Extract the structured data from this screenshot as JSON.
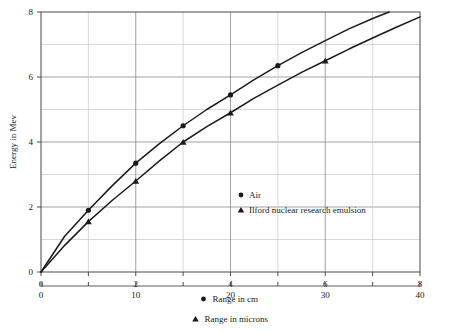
{
  "chart_data": {
    "type": "line",
    "title": "",
    "ylabel": "Energy in Mev",
    "ylim": [
      0,
      8
    ],
    "y_ticks": [
      0,
      2,
      4,
      6,
      8
    ],
    "y_tick_labels": [
      "0",
      "2",
      "4",
      "6",
      "8"
    ],
    "y_minor_gridlines": [
      1,
      2,
      3,
      4,
      5,
      6,
      7
    ],
    "grid": true,
    "legend_position": "inside-center-right",
    "x_axes": [
      {
        "name": "primary",
        "xlabel": "Range in cm",
        "marker": "circle",
        "xlim": [
          0,
          8
        ],
        "ticks": [
          0,
          1,
          2,
          3,
          4,
          5,
          6,
          7,
          8
        ],
        "tick_labels": [
          "0",
          "",
          "2",
          "",
          "4",
          "",
          "6",
          "",
          "8"
        ],
        "labeled_ticks": [
          {
            "value": 0,
            "label": "0"
          },
          {
            "value": 2,
            "label": "2"
          },
          {
            "value": 4,
            "label": "4"
          },
          {
            "value": 6,
            "label": "6"
          },
          {
            "value": 8,
            "label": "8"
          }
        ]
      },
      {
        "name": "secondary",
        "xlabel": "Range in microns",
        "marker": "triangle",
        "xlim": [
          0,
          40
        ],
        "ticks": [
          0,
          5,
          10,
          15,
          20,
          25,
          30,
          35,
          40
        ],
        "labeled_ticks": [
          {
            "value": 0,
            "label": "0"
          },
          {
            "value": 10,
            "label": "10"
          },
          {
            "value": 20,
            "label": "20"
          },
          {
            "value": 30,
            "label": "30"
          },
          {
            "value": 40,
            "label": "40"
          }
        ]
      }
    ],
    "series": [
      {
        "name": "Air",
        "marker": "circle",
        "x_axis": "primary",
        "x_unit": "cm",
        "points": [
          {
            "x": 1,
            "y": 1.9
          },
          {
            "x": 2,
            "y": 3.35
          },
          {
            "x": 3,
            "y": 4.5
          },
          {
            "x": 4,
            "y": 5.45
          },
          {
            "x": 5,
            "y": 6.35
          }
        ],
        "curve": [
          {
            "x": 0,
            "y": 0
          },
          {
            "x": 0.5,
            "y": 1.1
          },
          {
            "x": 1,
            "y": 1.9
          },
          {
            "x": 1.5,
            "y": 2.65
          },
          {
            "x": 2,
            "y": 3.35
          },
          {
            "x": 2.5,
            "y": 3.95
          },
          {
            "x": 3,
            "y": 4.5
          },
          {
            "x": 3.5,
            "y": 5.0
          },
          {
            "x": 4,
            "y": 5.45
          },
          {
            "x": 4.5,
            "y": 5.92
          },
          {
            "x": 5,
            "y": 6.35
          },
          {
            "x": 5.5,
            "y": 6.75
          },
          {
            "x": 6,
            "y": 7.12
          },
          {
            "x": 6.5,
            "y": 7.48
          },
          {
            "x": 7,
            "y": 7.8
          },
          {
            "x": 7.35,
            "y": 8.0
          }
        ]
      },
      {
        "name": "Ilford nuclear research emulsion",
        "marker": "triangle",
        "x_axis": "secondary",
        "x_unit": "microns",
        "points": [
          {
            "x": 5,
            "y": 1.55
          },
          {
            "x": 10,
            "y": 2.8
          },
          {
            "x": 15,
            "y": 4.0
          },
          {
            "x": 20,
            "y": 4.9
          },
          {
            "x": 30,
            "y": 6.5
          }
        ],
        "curve": [
          {
            "x": 0,
            "y": 0
          },
          {
            "x": 2.5,
            "y": 0.82
          },
          {
            "x": 5,
            "y": 1.55
          },
          {
            "x": 7.5,
            "y": 2.2
          },
          {
            "x": 10,
            "y": 2.8
          },
          {
            "x": 12.5,
            "y": 3.42
          },
          {
            "x": 15,
            "y": 4.0
          },
          {
            "x": 17.5,
            "y": 4.47
          },
          {
            "x": 20,
            "y": 4.9
          },
          {
            "x": 22.5,
            "y": 5.35
          },
          {
            "x": 25,
            "y": 5.75
          },
          {
            "x": 27.5,
            "y": 6.14
          },
          {
            "x": 30,
            "y": 6.5
          },
          {
            "x": 32.5,
            "y": 6.86
          },
          {
            "x": 35,
            "y": 7.2
          },
          {
            "x": 37.5,
            "y": 7.53
          },
          {
            "x": 40,
            "y": 7.85
          }
        ]
      }
    ],
    "legend": [
      {
        "label": "Air",
        "marker": "circle"
      },
      {
        "label": "Ilford nuclear research emulsion",
        "marker": "triangle"
      }
    ],
    "colors": {
      "curve": "#1a1a1a",
      "marker": "#1a1a1a",
      "axis": "#4a4a4a",
      "grid_major": "#7a7a7a",
      "grid_minor": "#c8c8c8",
      "background": "#ffffff",
      "text": "#1a1a1a"
    }
  }
}
